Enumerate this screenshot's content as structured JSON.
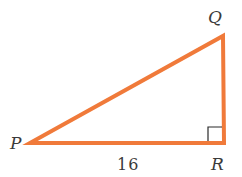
{
  "diagram": {
    "type": "right-triangle",
    "colors": {
      "stroke": "#f07a3a",
      "right_angle_marker": "#2a2a2a",
      "text": "#3a3a3a"
    },
    "vertices": {
      "P": {
        "label": "P",
        "x": 30,
        "y": 143
      },
      "Q": {
        "label": "Q",
        "x": 223,
        "y": 36
      },
      "R": {
        "label": "R",
        "x": 224,
        "y": 143
      }
    },
    "right_angle_at": "R",
    "side_labels": {
      "PR": "16"
    }
  }
}
